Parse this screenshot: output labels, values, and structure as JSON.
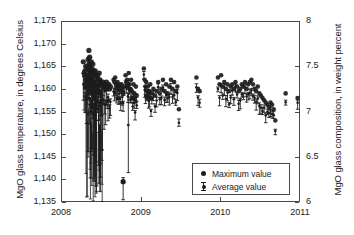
{
  "chart_data": {
    "type": "scatter",
    "title": "",
    "xlabel": "",
    "ylabel": "MgO glass temperature, in degrees Celsius",
    "y2label": "MgO glass composition, in weight percent",
    "xlim": [
      2008,
      2011
    ],
    "ylim": [
      1135,
      1175
    ],
    "y2lim": [
      6,
      8
    ],
    "xticks": [
      "2008",
      "2009",
      "2010",
      "2011"
    ],
    "xtick_values": [
      2008,
      2009,
      2010,
      2011
    ],
    "yticks": [
      "1,135",
      "1,140",
      "1,145",
      "1,150",
      "1,155",
      "1,160",
      "1,165",
      "1,170",
      "1,175"
    ],
    "ytick_values": [
      1135,
      1140,
      1145,
      1150,
      1155,
      1160,
      1165,
      1170,
      1175
    ],
    "y2ticks": [
      "6",
      "6.5",
      "7",
      "7.5",
      "8"
    ],
    "y2tick_values": [
      6,
      6.5,
      7,
      7.5,
      8
    ],
    "grid": false,
    "legend_position": "lower-right",
    "legend": [
      {
        "label": "Maximum value",
        "marker": "filled-circle",
        "color": "#1c1c1c"
      },
      {
        "label": "Average value",
        "marker": "error-bar",
        "color": "#1c1c1c"
      }
    ],
    "series": [
      {
        "name": "Maximum value",
        "marker": "filled-circle",
        "color": "#1c1c1c",
        "x": [
          2008.28,
          2008.29,
          2008.3,
          2008.3,
          2008.31,
          2008.31,
          2008.32,
          2008.32,
          2008.33,
          2008.33,
          2008.34,
          2008.34,
          2008.34,
          2008.35,
          2008.35,
          2008.35,
          2008.36,
          2008.36,
          2008.36,
          2008.37,
          2008.37,
          2008.37,
          2008.38,
          2008.38,
          2008.38,
          2008.39,
          2008.39,
          2008.39,
          2008.4,
          2008.4,
          2008.4,
          2008.41,
          2008.41,
          2008.41,
          2008.42,
          2008.42,
          2008.42,
          2008.43,
          2008.43,
          2008.43,
          2008.44,
          2008.44,
          2008.45,
          2008.45,
          2008.46,
          2008.46,
          2008.47,
          2008.47,
          2008.48,
          2008.48,
          2008.49,
          2008.49,
          2008.5,
          2008.5,
          2008.51,
          2008.52,
          2008.53,
          2008.54,
          2008.55,
          2008.56,
          2008.57,
          2008.58,
          2008.59,
          2008.6,
          2008.61,
          2008.62,
          2008.66,
          2008.67,
          2008.68,
          2008.69,
          2008.7,
          2008.71,
          2008.72,
          2008.73,
          2008.74,
          2008.75,
          2008.76,
          2008.77,
          2008.78,
          2008.79,
          2008.81,
          2008.82,
          2008.83,
          2008.84,
          2008.85,
          2008.86,
          2008.87,
          2008.88,
          2008.89,
          2008.9,
          2008.91,
          2008.92,
          2008.93,
          2008.94,
          2008.95,
          2009.04,
          2009.05,
          2009.06,
          2009.07,
          2009.08,
          2009.09,
          2009.1,
          2009.11,
          2009.12,
          2009.13,
          2009.14,
          2009.16,
          2009.18,
          2009.2,
          2009.22,
          2009.24,
          2009.26,
          2009.28,
          2009.3,
          2009.32,
          2009.34,
          2009.36,
          2009.38,
          2009.4,
          2009.42,
          2009.44,
          2009.46,
          2009.48,
          2009.7,
          2009.72,
          2009.74,
          2009.97,
          2009.99,
          2010.01,
          2010.03,
          2010.05,
          2010.07,
          2010.09,
          2010.11,
          2010.13,
          2010.15,
          2010.17,
          2010.19,
          2010.21,
          2010.23,
          2010.25,
          2010.27,
          2010.29,
          2010.31,
          2010.33,
          2010.35,
          2010.37,
          2010.39,
          2010.41,
          2010.43,
          2010.45,
          2010.47,
          2010.49,
          2010.51,
          2010.53,
          2010.55,
          2010.57,
          2010.59,
          2010.61,
          2010.63,
          2010.65,
          2010.67,
          2010.69,
          2010.82,
          2010.97
        ],
        "y": [
          1166.0,
          1163.5,
          1164.0,
          1161.0,
          1165.0,
          1162.0,
          1163.0,
          1160.5,
          1164.5,
          1161.5,
          1166.5,
          1163.0,
          1160.0,
          1168.5,
          1165.5,
          1162.5,
          1167.0,
          1164.0,
          1161.0,
          1165.0,
          1162.0,
          1159.5,
          1166.0,
          1163.5,
          1160.5,
          1164.5,
          1162.0,
          1159.0,
          1165.5,
          1163.0,
          1160.0,
          1164.0,
          1161.5,
          1158.5,
          1163.5,
          1161.0,
          1158.0,
          1164.0,
          1161.5,
          1159.0,
          1163.0,
          1160.5,
          1162.5,
          1160.0,
          1163.0,
          1160.5,
          1162.0,
          1159.5,
          1163.5,
          1161.0,
          1162.0,
          1159.5,
          1161.5,
          1159.0,
          1161.0,
          1160.5,
          1161.5,
          1160.0,
          1161.0,
          1160.5,
          1161.5,
          1160.0,
          1160.5,
          1161.0,
          1160.0,
          1160.5,
          1162.0,
          1161.5,
          1162.5,
          1161.0,
          1160.5,
          1161.5,
          1160.0,
          1161.0,
          1160.5,
          1159.5,
          1161.0,
          1160.0,
          1159.0,
          1160.5,
          1163.0,
          1161.5,
          1162.0,
          1160.5,
          1163.5,
          1161.0,
          1160.0,
          1162.0,
          1159.5,
          1158.0,
          1161.0,
          1159.0,
          1157.5,
          1160.5,
          1158.5,
          1164.5,
          1162.0,
          1160.5,
          1161.5,
          1159.5,
          1160.5,
          1158.5,
          1159.5,
          1161.0,
          1158.0,
          1159.0,
          1160.0,
          1158.5,
          1159.5,
          1161.5,
          1159.0,
          1160.0,
          1162.0,
          1159.5,
          1161.0,
          1159.0,
          1160.5,
          1162.0,
          1160.0,
          1161.5,
          1159.5,
          1160.5,
          1155.5,
          1162.5,
          1160.0,
          1159.5,
          1162.5,
          1161.0,
          1163.0,
          1160.5,
          1161.5,
          1160.0,
          1161.0,
          1159.5,
          1160.5,
          1161.0,
          1160.0,
          1161.5,
          1160.5,
          1159.5,
          1160.0,
          1161.0,
          1160.5,
          1161.5,
          1160.0,
          1161.0,
          1161.5,
          1162.0,
          1161.0,
          1160.0,
          1159.5,
          1160.5,
          1159.0,
          1158.5,
          1158.0,
          1157.5,
          1157.0,
          1156.5,
          1156.0,
          1157.0,
          1156.5,
          1155.5,
          1153.0,
          1159.0,
          1158.0
        ],
        "outliers": [
          {
            "x": 2008.78,
            "y": 1139.5,
            "note": "low maximum value outlier"
          }
        ]
      },
      {
        "name": "Average value",
        "marker": "error-bar",
        "color": "#1c1c1c",
        "note": "Vertical error bars drawn beneath each maximum value marker; lower whiskers reach as low as 1,135 in early 2008 and 1,141.5 near 2008.85."
      }
    ]
  },
  "axes": {
    "left_title": "MgO glass temperature, in degrees Celsius",
    "right_title": "MgO glass composition, in weight percent"
  },
  "legend": {
    "items": [
      {
        "label": "Maximum value"
      },
      {
        "label": "Average value"
      }
    ]
  }
}
